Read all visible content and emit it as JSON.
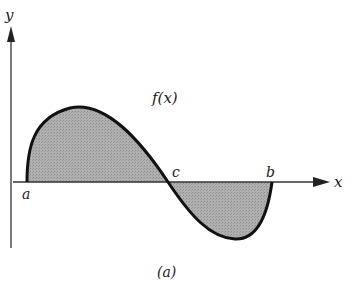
{
  "figure": {
    "caption": "(a)",
    "function_label": "f(x)",
    "axes": {
      "x_label": "x",
      "y_label": "y"
    },
    "points": [
      {
        "name": "a",
        "label": "a"
      },
      {
        "name": "c",
        "label": "c"
      },
      {
        "name": "b",
        "label": "b"
      }
    ],
    "colors": {
      "curve": "#111111",
      "fill": "#a8a8a8",
      "axis": "#333333",
      "background": "#ffffff"
    }
  }
}
